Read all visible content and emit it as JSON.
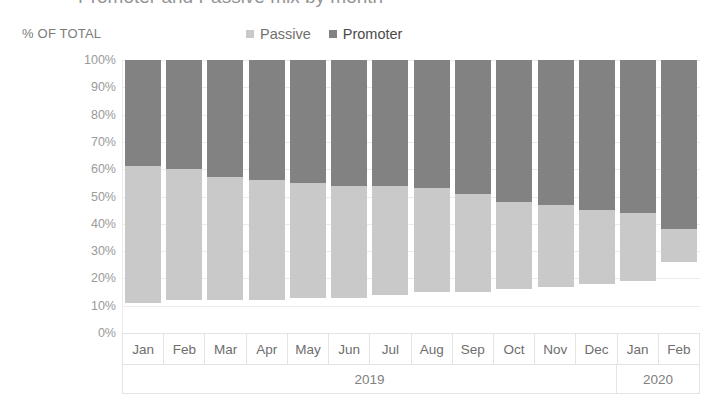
{
  "title_partial": "Promoter and Passive mix by month",
  "axis_caption": "% OF TOTAL",
  "legend": [
    {
      "label": "Passive",
      "color": "#c9c9c9",
      "key": "passive"
    },
    {
      "label": "Promoter",
      "color": "#828282",
      "key": "promoter"
    }
  ],
  "colors": {
    "passive": "#c9c9c9",
    "promoter": "#828282",
    "gridline": "#ebebeb",
    "axis_text": "#9a9a9a",
    "category_text": "#6e6e6e",
    "background": "#ffffff"
  },
  "year_groups": [
    {
      "label": "2019",
      "span": 12
    },
    {
      "label": "2020",
      "span": 2
    }
  ],
  "chart_data": {
    "type": "bar",
    "title": "Promoter and Passive mix by month",
    "subtype": "stacked-100-percent",
    "xlabel": "",
    "ylabel": "% OF TOTAL",
    "ylim": [
      0,
      100
    ],
    "ytick_labels": [
      "100%",
      "90%",
      "80%",
      "70%",
      "60%",
      "50%",
      "40%",
      "30%",
      "20%",
      "10%",
      "0%"
    ],
    "ytick_values": [
      100,
      90,
      80,
      70,
      60,
      50,
      40,
      30,
      20,
      10,
      0
    ],
    "grid": true,
    "legend_position": "top-center",
    "categories": [
      "Jan",
      "Feb",
      "Mar",
      "Apr",
      "May",
      "Jun",
      "Jul",
      "Aug",
      "Sep",
      "Oct",
      "Nov",
      "Dec",
      "Jan",
      "Feb"
    ],
    "category_years": [
      "2019",
      "2019",
      "2019",
      "2019",
      "2019",
      "2019",
      "2019",
      "2019",
      "2019",
      "2019",
      "2019",
      "2019",
      "2020",
      "2020"
    ],
    "series": [
      {
        "name": "Promoter",
        "color": "#828282",
        "values": [
          39,
          40,
          43,
          44,
          45,
          46,
          46,
          47,
          49,
          52,
          53,
          55,
          56,
          62
        ],
        "stack_bottom": [
          61,
          60,
          57,
          56,
          55,
          54,
          54,
          53,
          51,
          48,
          47,
          45,
          44,
          38
        ],
        "stack_top": [
          100,
          100,
          100,
          100,
          100,
          100,
          100,
          100,
          100,
          100,
          100,
          100,
          100,
          100
        ]
      },
      {
        "name": "Passive",
        "color": "#c9c9c9",
        "values": [
          50,
          48,
          45,
          44,
          42,
          41,
          40,
          38,
          36,
          32,
          30,
          27,
          25,
          12
        ],
        "stack_bottom": [
          11,
          12,
          12,
          12,
          13,
          13,
          14,
          15,
          15,
          16,
          17,
          18,
          19,
          26
        ],
        "stack_top": [
          61,
          60,
          57,
          56,
          55,
          54,
          54,
          53,
          51,
          48,
          47,
          45,
          44,
          38
        ]
      }
    ]
  }
}
